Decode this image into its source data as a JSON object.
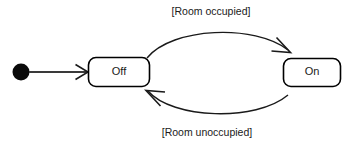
{
  "diagram": {
    "type": "uml-state-machine",
    "background_color": "#ffffff",
    "stroke_color": "#1a1a1a",
    "text_color": "#1a1a1a",
    "initial_pseudostate": {
      "name": "initial-state",
      "shape": "filled-circle"
    },
    "states": [
      {
        "id": "off",
        "label": "Off"
      },
      {
        "id": "on",
        "label": "On"
      }
    ],
    "transitions": [
      {
        "id": "off-to-on",
        "from": "Off",
        "to": "On",
        "guard": "[Room occupied]",
        "position": "top"
      },
      {
        "id": "on-to-off",
        "from": "On",
        "to": "Off",
        "guard": "[Room unoccupied]",
        "position": "bottom"
      },
      {
        "id": "initial-to-off",
        "from": "initial",
        "to": "Off",
        "guard": "",
        "position": "left"
      }
    ]
  }
}
